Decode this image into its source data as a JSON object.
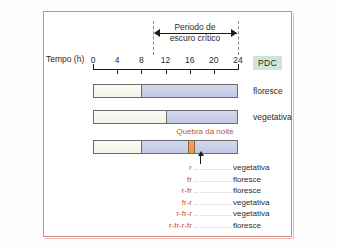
{
  "figure": {
    "axis": {
      "title": "Tempo (h)",
      "ticks": [
        "0",
        "4",
        "8",
        "12",
        "16",
        "20",
        "24"
      ],
      "tick_values": [
        0,
        4,
        8,
        12,
        16,
        20,
        24
      ],
      "range": [
        0,
        24
      ]
    },
    "bracket": {
      "label_line1": "Periodo de",
      "label_line2": "escuro crítico",
      "start_hour": 10,
      "end_hour": 24
    },
    "badge": {
      "label": "PDC"
    },
    "bars": [
      {
        "name": "bar-row-1",
        "day_end_hour": 8,
        "night_break_hour": null,
        "outcome": "floresce"
      },
      {
        "name": "bar-row-2",
        "day_end_hour": 12,
        "night_break_hour": null,
        "outcome": "vegetativa"
      },
      {
        "name": "bar-row-3",
        "day_end_hour": 8,
        "night_break_hour": 16,
        "outcome": ""
      }
    ],
    "night_break": {
      "label": "Quebra da noite",
      "hour": 16
    },
    "legend": {
      "dots": "..............",
      "rows": [
        {
          "code": "r",
          "outcome": "vegetativa"
        },
        {
          "code": "fr",
          "outcome": "floresce"
        },
        {
          "code": "r-fr",
          "outcome": "floresce"
        },
        {
          "code": "fr-r",
          "outcome": "vegetativa"
        },
        {
          "code": "r-fr-r",
          "outcome": "vegetativa"
        },
        {
          "code": "r-fr-r-fr",
          "outcome": "floresce"
        }
      ]
    },
    "colors": {
      "border": "#d98b82",
      "day": "#f7f7ec",
      "night": "#c9cee8",
      "break": "#e8a04e",
      "badge_bg": "#cfe4d4",
      "accent_text": "#c0563c"
    }
  }
}
